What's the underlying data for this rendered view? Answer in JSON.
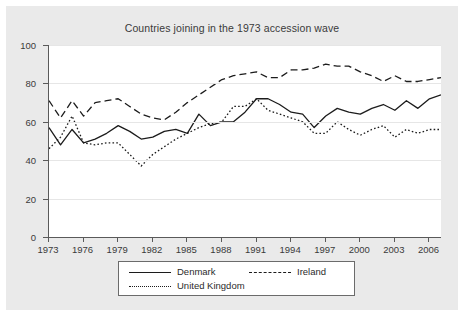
{
  "chart_data": {
    "type": "line",
    "title": "Countries joining in the 1973 accession wave",
    "xlabel": "",
    "ylabel": "",
    "xlim": [
      1973,
      2007
    ],
    "ylim": [
      0,
      100
    ],
    "grid": true,
    "legend_position": "bottom-center",
    "x_ticks": [
      "1973",
      "1976",
      "1979",
      "1982",
      "1985",
      "1988",
      "1991",
      "1994",
      "1997",
      "2000",
      "2003",
      "2006"
    ],
    "x_tick_values": [
      1973,
      1976,
      1979,
      1982,
      1985,
      1988,
      1991,
      1994,
      1997,
      2000,
      2003,
      2006
    ],
    "y_ticks": [
      "0",
      "20",
      "40",
      "60",
      "80",
      "100"
    ],
    "y_tick_values": [
      0,
      20,
      40,
      60,
      80,
      100
    ],
    "x": [
      1973,
      1974,
      1975,
      1976,
      1977,
      1978,
      1979,
      1980,
      1981,
      1982,
      1983,
      1984,
      1985,
      1986,
      1987,
      1988,
      1989,
      1990,
      1991,
      1992,
      1993,
      1994,
      1995,
      1996,
      1997,
      1998,
      1999,
      2000,
      2001,
      2002,
      2003,
      2004,
      2005,
      2006,
      2007
    ],
    "series": [
      {
        "name": "Denmark",
        "style": "solid",
        "color": "#1c1c1c",
        "values": [
          57,
          48,
          56,
          49,
          51,
          54,
          58,
          55,
          51,
          52,
          55,
          56,
          54,
          64,
          58,
          60,
          60,
          65,
          72,
          72,
          69,
          65,
          64,
          57,
          63,
          67,
          65,
          64,
          67,
          69,
          66,
          71,
          67,
          72,
          74
        ]
      },
      {
        "name": "Ireland",
        "style": "dashed",
        "color": "#1c1c1c",
        "values": [
          71,
          62,
          71,
          63,
          70,
          71,
          72,
          68,
          64,
          62,
          61,
          65,
          70,
          74,
          78,
          82,
          84,
          85,
          86,
          83,
          83,
          87,
          87,
          88,
          90,
          89,
          89,
          86,
          84,
          81,
          84,
          81,
          81,
          82,
          83
        ]
      },
      {
        "name": "United Kingdom",
        "style": "dotted",
        "color": "#1c1c1c",
        "values": [
          46,
          52,
          63,
          49,
          48,
          49,
          49,
          43,
          37,
          43,
          47,
          51,
          54,
          57,
          59,
          60,
          68,
          68,
          72,
          66,
          64,
          62,
          60,
          54,
          54,
          60,
          56,
          53,
          56,
          58,
          52,
          56,
          54,
          56,
          56
        ]
      }
    ]
  },
  "legend": {
    "entries": [
      {
        "label": "Denmark",
        "style": "solid"
      },
      {
        "label": "Ireland",
        "style": "dashed"
      },
      {
        "label": "United Kingdom",
        "style": "dotted"
      }
    ]
  }
}
